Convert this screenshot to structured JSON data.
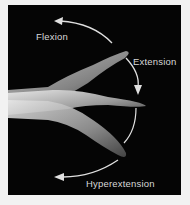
{
  "figure": {
    "labels": {
      "flexion": "Flexion",
      "extension": "Extension",
      "hyperextension": "Hyperextension"
    },
    "colors": {
      "background": "#050505",
      "frame": "#f2f2f2",
      "arrow": "#e0e0e0",
      "skin": "#c8c8c8"
    }
  }
}
